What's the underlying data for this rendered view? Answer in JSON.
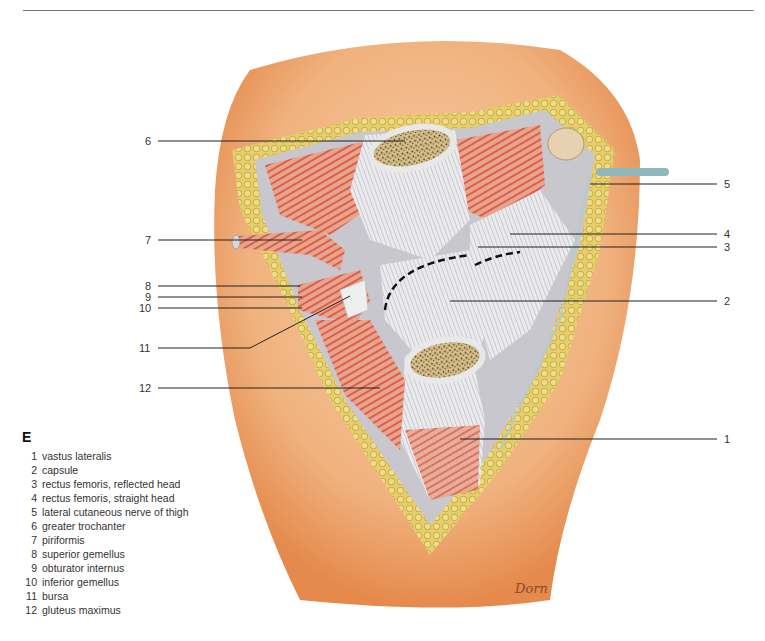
{
  "figure": {
    "panel_letter": "E",
    "signature": "Dorn",
    "colors": {
      "skin": "#f0b27e",
      "skin_dark": "#e58a4c",
      "fat": "#e6cf6a",
      "fat_border": "#b59a35",
      "muscle": "#d9614a",
      "tendon": "#e4e4e8",
      "bone_cut": "#d7c08a",
      "bone_marrow": "#4a3a25",
      "nerve": "#8fb7bb",
      "label_line": "#222222"
    }
  },
  "labels": [
    {
      "num": "1",
      "text": "vastus lateralis"
    },
    {
      "num": "2",
      "text": "capsule"
    },
    {
      "num": "3",
      "text": "rectus femoris, reflected head"
    },
    {
      "num": "4",
      "text": "rectus femoris, straight head"
    },
    {
      "num": "5",
      "text": "lateral cutaneous nerve of thigh"
    },
    {
      "num": "6",
      "text": "greater trochanter"
    },
    {
      "num": "7",
      "text": "piriformis"
    },
    {
      "num": "8",
      "text": "superior gemellus"
    },
    {
      "num": "9",
      "text": "obturator internus"
    },
    {
      "num": "10",
      "text": "inferior gemellus"
    },
    {
      "num": "11",
      "text": "bursa"
    },
    {
      "num": "12",
      "text": "gluteus maximus"
    }
  ],
  "callouts": {
    "n1": "1",
    "n2": "2",
    "n3": "3",
    "n4": "4",
    "n5": "5",
    "n6": "6",
    "n7": "7",
    "n8": "8",
    "n9": "9",
    "n10": "10",
    "n11": "11",
    "n12": "12"
  }
}
